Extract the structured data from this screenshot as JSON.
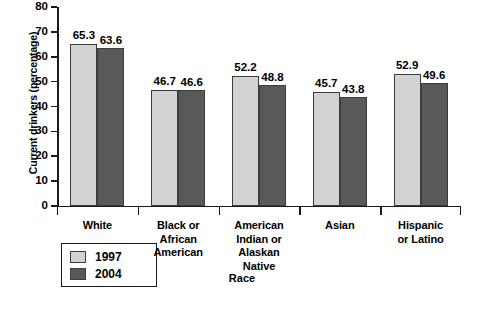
{
  "chart_data": {
    "type": "bar",
    "title": "",
    "xlabel": "Race",
    "ylabel": "Current drinkers (percentage)",
    "categories": [
      "White",
      "Black or African American",
      "American Indian or Alaskan Native",
      "Asian",
      "Hispanic or Latino"
    ],
    "category_lines": [
      [
        "White"
      ],
      [
        "Black or",
        "African",
        "American"
      ],
      [
        "American",
        "Indian or",
        "Alaskan",
        "Native"
      ],
      [
        "Asian"
      ],
      [
        "Hispanic",
        "or Latino"
      ]
    ],
    "series": [
      {
        "name": "1997",
        "color": "#d2d2d2",
        "values": [
          65.3,
          46.7,
          52.2,
          45.7,
          52.9
        ]
      },
      {
        "name": "2004",
        "color": "#595959",
        "values": [
          63.6,
          46.6,
          48.8,
          43.8,
          49.6
        ]
      }
    ],
    "ylim": [
      0,
      80
    ],
    "ytick_labels": [
      "80",
      "70",
      "60",
      "50",
      "40",
      "30",
      "20",
      "10",
      "0"
    ],
    "ytick_values": [
      80,
      70,
      60,
      50,
      40,
      30,
      20,
      10,
      0
    ],
    "grid": false,
    "legend_position": "below-left",
    "legend_entries": [
      {
        "label": "1997",
        "color": "#d2d2d2"
      },
      {
        "label": "2004",
        "color": "#595959"
      }
    ]
  }
}
